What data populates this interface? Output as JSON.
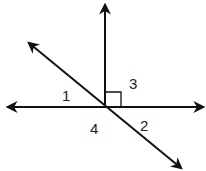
{
  "diagram": {
    "type": "intersecting-lines-angles",
    "intersection": [
      105,
      107
    ],
    "colors": {
      "stroke": "#111111",
      "background": "#ffffff"
    },
    "lines": [
      {
        "name": "horizontal-line",
        "from": [
          8,
          107
        ],
        "to": [
          203,
          107
        ],
        "arrows": "both"
      },
      {
        "name": "vertical-ray",
        "from": [
          105,
          107
        ],
        "to": [
          105,
          5
        ],
        "arrows": "end"
      },
      {
        "name": "diagonal-line",
        "from": [
          29,
          43
        ],
        "to": [
          181,
          168
        ],
        "arrows": "both"
      }
    ],
    "right_angle_marker": {
      "x": 105,
      "y": 92,
      "size": 15
    },
    "angle_labels": [
      {
        "id": "angle-1",
        "text": "1",
        "x": 62,
        "y": 101
      },
      {
        "id": "angle-3",
        "text": "3",
        "x": 129,
        "y": 89
      },
      {
        "id": "angle-4",
        "text": "4",
        "x": 90,
        "y": 134
      },
      {
        "id": "angle-2",
        "text": "2",
        "x": 140,
        "y": 131
      }
    ]
  }
}
